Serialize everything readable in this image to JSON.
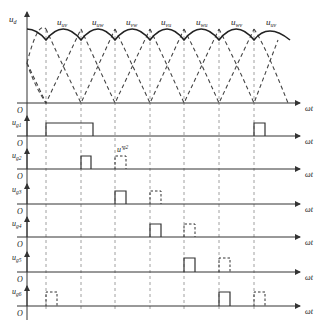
{
  "axes": {
    "y_label_main": "u",
    "y_label_main_sub": "d",
    "origin_label": "O",
    "x_label": "ωt"
  },
  "line_voltages": [
    {
      "label": "u",
      "sub": "uv"
    },
    {
      "label": "u",
      "sub": "uw"
    },
    {
      "label": "u",
      "sub": "vw"
    },
    {
      "label": "u",
      "sub": "vu"
    },
    {
      "label": "u",
      "sub": "wu"
    },
    {
      "label": "u",
      "sub": "wv"
    },
    {
      "label": "u",
      "sub": "uv"
    }
  ],
  "pulse_rows": [
    {
      "label": "u",
      "sub": "g1"
    },
    {
      "label": "u",
      "sub": "g2"
    },
    {
      "label": "u",
      "sub": "g3"
    },
    {
      "label": "u",
      "sub": "g4"
    },
    {
      "label": "u",
      "sub": "g5"
    },
    {
      "label": "u",
      "sub": "g6"
    }
  ],
  "annotation": {
    "label": "u'",
    "sub": "g2"
  },
  "colors": {
    "line": "#333333",
    "dashed": "#555555",
    "guide": "#888888"
  }
}
